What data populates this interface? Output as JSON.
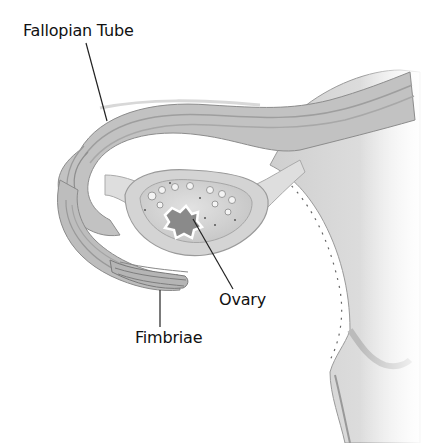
{
  "diagram": {
    "style": "grayscale illustration",
    "labels": [
      {
        "id": "fallopian-tube",
        "text": "Fallopian Tube",
        "x": 23,
        "y": 24,
        "pointer_from": [
          86,
          43
        ],
        "pointer_to": [
          107,
          121
        ]
      },
      {
        "id": "ovary",
        "text": "Ovary",
        "x": 219,
        "y": 293,
        "pointer_from": [
          233,
          289
        ],
        "pointer_to": [
          193,
          219
        ]
      },
      {
        "id": "fimbriae",
        "text": "Fimbriae",
        "x": 135,
        "y": 331,
        "pointer_from": [
          160,
          327
        ],
        "pointer_to": [
          160,
          290
        ]
      }
    ],
    "colors": {
      "background": "#ffffff",
      "tissue_light": "#e4e4e4",
      "tissue_mid": "#bdbdbd",
      "tissue_dark": "#8a8a8a",
      "label_text": "#111111",
      "leader_line": "#222222"
    }
  }
}
